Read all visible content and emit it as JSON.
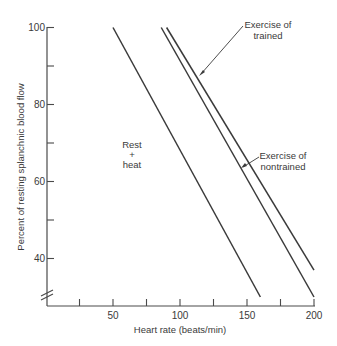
{
  "chart_data": {
    "type": "line",
    "title": "",
    "xlabel": "Heart rate (beats/min)",
    "ylabel": "Percent of resting splanchnic blood flow",
    "xlim": [
      0,
      200
    ],
    "ylim": [
      30,
      100
    ],
    "x_ticks": [
      25,
      50,
      75,
      100,
      125,
      150,
      175,
      200
    ],
    "x_tick_labels": [
      "",
      "50",
      "",
      "100",
      "",
      "150",
      "",
      "200"
    ],
    "y_ticks": [
      100,
      90,
      80,
      70,
      60,
      50,
      40
    ],
    "y_tick_labels": [
      "100",
      "",
      "80",
      "",
      "60",
      "",
      "40"
    ],
    "y_axis_break": true,
    "grid": false,
    "legend": "none (inline annotations)",
    "series": [
      {
        "name": "Rest + heat",
        "label_lines": [
          "Rest",
          "+",
          "heat"
        ],
        "x": [
          50,
          160
        ],
        "y": [
          100,
          30
        ]
      },
      {
        "name": "Exercise of nontrained",
        "label_lines": [
          "Exercise of",
          "nontrained"
        ],
        "x": [
          86,
          200
        ],
        "y": [
          100,
          30
        ]
      },
      {
        "name": "Exercise of trained",
        "label_lines": [
          "Exercise of",
          "trained"
        ],
        "x": [
          90,
          200
        ],
        "y": [
          100,
          37
        ]
      }
    ]
  }
}
